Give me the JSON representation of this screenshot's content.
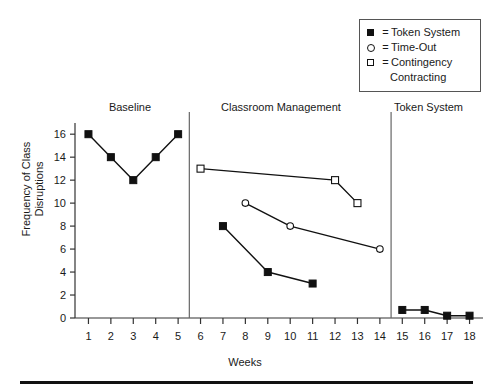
{
  "chart_data": {
    "type": "line",
    "title": "",
    "xlabel": "Weeks",
    "ylabel": "Frequency of Class\nDisruptions",
    "xlim": [
      0.4,
      18.6
    ],
    "ylim": [
      0,
      16.8
    ],
    "xticks": [
      1,
      2,
      3,
      4,
      5,
      6,
      7,
      8,
      9,
      10,
      11,
      12,
      13,
      14,
      15,
      16,
      17,
      18
    ],
    "yticks": [
      0,
      2,
      4,
      6,
      8,
      10,
      12,
      14,
      16
    ],
    "grid": false,
    "legend_position": "top-right",
    "phases": [
      {
        "label": "Baseline",
        "x_start": 0.4,
        "x_end": 5.5
      },
      {
        "label": "Classroom Management",
        "x_start": 5.5,
        "x_end": 14.5
      },
      {
        "label": "Token System",
        "x_start": 14.5,
        "x_end": 18.6
      }
    ],
    "phase_divider_x": [
      5.5,
      14.5
    ],
    "series": [
      {
        "name": "Token System",
        "marker": "filled-square",
        "segments": [
          {
            "phase": "Baseline",
            "x": [
              1,
              2,
              3,
              4,
              5
            ],
            "values": [
              16,
              14,
              12,
              14,
              16
            ]
          },
          {
            "phase": "Classroom Management",
            "x": [
              7,
              9,
              11
            ],
            "values": [
              8,
              4,
              3
            ]
          },
          {
            "phase": "Token System",
            "x": [
              15,
              16,
              17,
              18
            ],
            "values": [
              0.7,
              0.7,
              0.2,
              0.2
            ]
          }
        ]
      },
      {
        "name": "Time-Out",
        "marker": "open-circle",
        "segments": [
          {
            "phase": "Classroom Management",
            "x": [
              8,
              10,
              14
            ],
            "values": [
              10,
              8,
              6
            ]
          }
        ]
      },
      {
        "name": "Contingency Contracting",
        "marker": "open-square",
        "segments": [
          {
            "phase": "Classroom Management",
            "x": [
              6,
              12,
              13
            ],
            "values": [
              13,
              12,
              10
            ]
          }
        ]
      }
    ]
  },
  "legend": {
    "equals": "=",
    "entries": [
      {
        "marker": "filled-square",
        "label": "Token System"
      },
      {
        "marker": "open-circle",
        "label": "Time-Out"
      },
      {
        "marker": "open-square",
        "label": "Contingency"
      },
      {
        "marker": "none",
        "label": "Contracting"
      }
    ]
  },
  "axis": {
    "x_title": "Weeks",
    "y_title_line1": "Frequency of Class",
    "y_title_line2": "Disruptions",
    "x_tick_labels": [
      "1",
      "2",
      "3",
      "4",
      "5",
      "6",
      "7",
      "8",
      "9",
      "10",
      "11",
      "12",
      "13",
      "14",
      "15",
      "16",
      "17",
      "18"
    ],
    "y_tick_labels": [
      "16",
      "14",
      "12",
      "10",
      "8",
      "6",
      "4",
      "2",
      "0"
    ]
  },
  "phases": {
    "baseline": "Baseline",
    "classroom_management": "Classroom Management",
    "token_system": "Token System"
  },
  "colors": {
    "line": "#111111",
    "axis": "#333333",
    "divider": "#666666",
    "background": "#ffffff",
    "legend_border": "#555555"
  }
}
